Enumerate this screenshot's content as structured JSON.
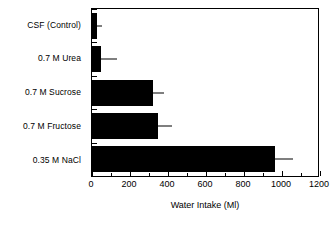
{
  "chart_data": {
    "type": "bar",
    "orientation": "horizontal",
    "title": "",
    "xlabel": "Water Intake (Ml)",
    "ylabel": "",
    "categories": [
      "CSF  (Control)",
      "0.7 M Urea",
      "0.7 M Sucrose",
      "0.7 M Fructose",
      "0.35 M NaCl"
    ],
    "values": [
      25,
      47,
      320,
      347,
      965
    ],
    "errors": [
      28,
      85,
      60,
      74,
      95
    ],
    "xlim": [
      0,
      1200
    ],
    "xticks": [
      0,
      200,
      400,
      600,
      800,
      1000,
      1200
    ],
    "xticklabels": [
      "0",
      "200",
      "400",
      "600",
      "800",
      "1000",
      "1200"
    ],
    "xminorticks": [
      100,
      300,
      500,
      700,
      900,
      1100
    ],
    "grid": false,
    "legend": null,
    "bar_color": "#000000",
    "frame_color": "#000000",
    "background_color": "#ffffff"
  }
}
